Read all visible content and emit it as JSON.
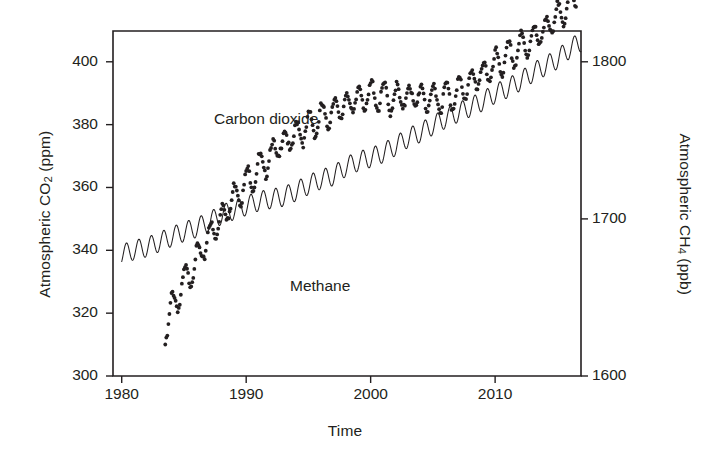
{
  "figure": {
    "name": "atmospheric-greenhouse-gas-trends",
    "background_color": "#ffffff",
    "ink_color": "#231f20"
  },
  "axes": {
    "x": {
      "label": "Time",
      "ticks": [
        "1980",
        "1990",
        "2000",
        "2010"
      ],
      "tick_values": [
        1980,
        1990,
        2000,
        2010
      ],
      "range": [
        1979.3,
        2016.9
      ]
    },
    "y_left": {
      "label_prefix": "Atmospheric CO",
      "label_sub": "2",
      "label_suffix": " (ppm)",
      "label_plain": "Atmospheric CO2 (ppm)",
      "ticks": [
        "300",
        "320",
        "340",
        "360",
        "380",
        "400"
      ],
      "tick_values": [
        300,
        320,
        340,
        360,
        380,
        400
      ],
      "range": [
        300,
        409.8
      ]
    },
    "y_right": {
      "label_prefix": "Atmospheric CH",
      "label_sub": "4",
      "label_suffix": " (ppb)",
      "label_plain": "Atmospheric CH4 (ppb)",
      "ticks": [
        "1600",
        "1700",
        "1800",
        "1900",
        "2000"
      ],
      "tick_values": [
        1600,
        1700,
        1800,
        1900,
        2000
      ],
      "range": [
        1600,
        1819.6
      ]
    }
  },
  "annotations": {
    "co2_label": "Carbon dioxide",
    "ch4_label": "Methane"
  },
  "chart_data": {
    "type": "line",
    "title": "",
    "xlabel": "Time",
    "ylabel": "Atmospheric CO2 (ppm)",
    "ylabel_secondary": "Atmospheric CH4 (ppb)",
    "xlim": [
      1979.3,
      2016.9
    ],
    "ylim": [
      300,
      409.8
    ],
    "ylim_secondary": [
      1600,
      1819.6
    ],
    "grid": false,
    "legend": "inline-annotations",
    "series": [
      {
        "name": "Carbon dioxide",
        "style": "line",
        "axis": "left",
        "units": "ppm",
        "seasonal_amplitude_ppm": 3.1,
        "x": [
          1980,
          1981,
          1982,
          1983,
          1984,
          1985,
          1986,
          1987,
          1988,
          1989,
          1990,
          1991,
          1992,
          1993,
          1994,
          1995,
          1996,
          1997,
          1998,
          1999,
          2000,
          2001,
          2002,
          2003,
          2004,
          2005,
          2006,
          2007,
          2008,
          2009,
          2010,
          2011,
          2012,
          2013,
          2014,
          2015,
          2016,
          2017
        ],
        "values": [
          338.7,
          340.1,
          341.0,
          342.6,
          344.3,
          345.9,
          347.2,
          349.0,
          351.3,
          352.8,
          354.2,
          355.6,
          356.4,
          357.1,
          358.8,
          360.8,
          362.6,
          363.7,
          366.6,
          368.3,
          369.5,
          371.0,
          373.2,
          375.8,
          377.5,
          379.8,
          381.9,
          383.8,
          385.6,
          387.4,
          389.9,
          391.6,
          393.8,
          396.5,
          398.6,
          400.8,
          404.2,
          406.6
        ]
      },
      {
        "name": "Methane",
        "style": "scatter",
        "axis": "right",
        "units": "ppb",
        "x": [
          1983.5,
          1984,
          1984.5,
          1985,
          1985.5,
          1986,
          1986.5,
          1987,
          1987.5,
          1988,
          1988.5,
          1989,
          1989.5,
          1990,
          1990.5,
          1991,
          1991.5,
          1992,
          1992.5,
          1993,
          1993.5,
          1994,
          1994.5,
          1995,
          1995.5,
          1996,
          1996.5,
          1997,
          1997.5,
          1998,
          1998.5,
          1999,
          1999.5,
          2000,
          2000.5,
          2001,
          2001.5,
          2002,
          2002.5,
          2003,
          2003.5,
          2004,
          2004.5,
          2005,
          2005.5,
          2006,
          2006.5,
          2007,
          2007.5,
          2008,
          2008.5,
          2009,
          2009.5,
          2010,
          2010.5,
          2011,
          2011.5,
          2012,
          2012.5,
          2013,
          2013.5,
          2014,
          2014.5,
          2015,
          2015.5,
          2016,
          2016.5
        ],
        "values": [
          1629,
          1645,
          1652,
          1660,
          1668,
          1674,
          1682,
          1690,
          1696,
          1702,
          1709,
          1715,
          1720,
          1724,
          1729,
          1733,
          1737,
          1742,
          1747,
          1750,
          1752,
          1755,
          1758,
          1760,
          1763,
          1765,
          1768,
          1770,
          1772,
          1774,
          1776,
          1778,
          1779,
          1780,
          1780,
          1779,
          1778,
          1778,
          1779,
          1779,
          1780,
          1779,
          1778,
          1778,
          1779,
          1779,
          1780,
          1782,
          1785,
          1788,
          1791,
          1794,
          1796,
          1799,
          1802,
          1804,
          1807,
          1810,
          1813,
          1816,
          1819,
          1822,
          1826,
          1830,
          1834,
          1839,
          1845
        ]
      }
    ]
  }
}
